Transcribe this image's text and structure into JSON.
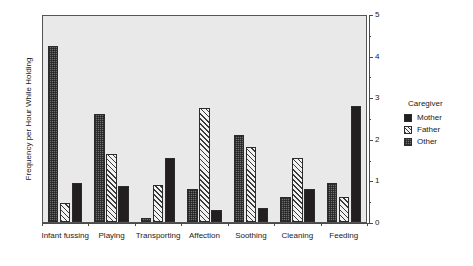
{
  "chart_data": {
    "type": "bar",
    "title": "",
    "subtitle": "",
    "xlabel": "",
    "ylabel": "Frequency per Hour While Holding",
    "ylim": [
      0,
      5
    ],
    "y_ticks": [
      0,
      1,
      2,
      3,
      4,
      5
    ],
    "y_tick_labels": [
      "0",
      "1",
      "2",
      "3",
      "4",
      "5"
    ],
    "y_minor_ticks": [
      0.5,
      1.5,
      2.5,
      3.5,
      4.5
    ],
    "y_axis_position": "right",
    "grid": false,
    "legend_position": "right",
    "legend_title": "Caregiver",
    "categories": [
      "Infant fussing",
      "Playing",
      "Transporting",
      "Affection",
      "Soothing",
      "Cleaning",
      "Feeding"
    ],
    "series_order_in_group": [
      "Other",
      "Father",
      "Mother"
    ],
    "series": [
      {
        "name": "Mother",
        "fill": "solid-black",
        "color": "#231f20",
        "values": [
          0.95,
          0.88,
          1.55,
          0.28,
          0.35,
          0.8,
          2.8
        ]
      },
      {
        "name": "Father",
        "fill": "diagonal-hatch",
        "color": "#f2f2f2",
        "values": [
          0.45,
          1.65,
          0.9,
          2.75,
          1.8,
          1.55,
          0.6
        ]
      },
      {
        "name": "Other",
        "fill": "cross-hatch-gray",
        "color": "#6e6e6e",
        "values": [
          4.25,
          2.6,
          0.1,
          0.8,
          2.1,
          0.6,
          0.95
        ]
      }
    ]
  },
  "legend": {
    "title": "Caregiver",
    "items": [
      {
        "label": "Mother",
        "swatch": "mother"
      },
      {
        "label": "Father",
        "swatch": "father"
      },
      {
        "label": "Other",
        "swatch": "other"
      }
    ]
  },
  "axes": {
    "y_title": "Frequency per Hour While Holding"
  }
}
